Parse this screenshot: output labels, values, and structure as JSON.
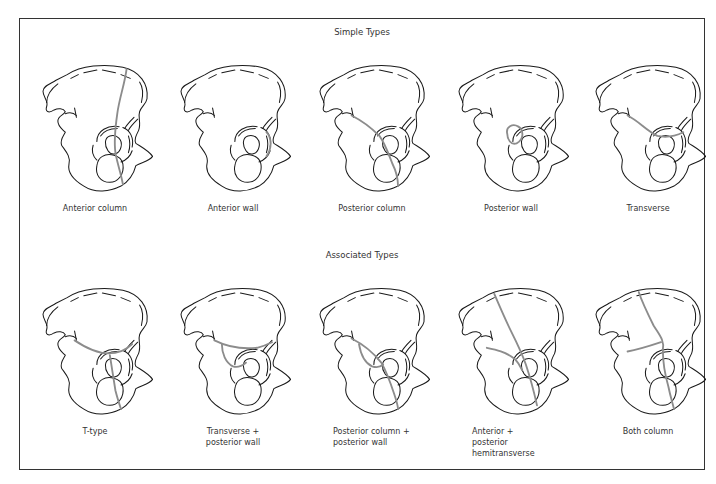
{
  "figure": {
    "rows": [
      {
        "title": "Simple Types",
        "panels": [
          {
            "label": "Anterior column",
            "fracture": "anterior-column"
          },
          {
            "label": "Anterior wall",
            "fracture": "anterior-wall"
          },
          {
            "label": "Posterior column",
            "fracture": "posterior-column"
          },
          {
            "label": "Posterior wall",
            "fracture": "posterior-wall"
          },
          {
            "label": "Transverse",
            "fracture": "transverse"
          }
        ]
      },
      {
        "title": "Associated Types",
        "panels": [
          {
            "label": "T-type",
            "fracture": "t-type"
          },
          {
            "label": "Transverse +\nposterior wall",
            "fracture": "transverse-posterior-wall"
          },
          {
            "label": "Posterior column +\nposterior wall",
            "fracture": "posterior-column-posterior-wall"
          },
          {
            "label": "Anterior +\nposterior\nhemitransverse",
            "fracture": "anterior-posterior-hemitransverse"
          },
          {
            "label": "Both column",
            "fracture": "both-column"
          }
        ]
      }
    ],
    "colors": {
      "outline": "#1a1a1a",
      "fracture": "#8c8c8c",
      "frame": "#333333"
    }
  }
}
